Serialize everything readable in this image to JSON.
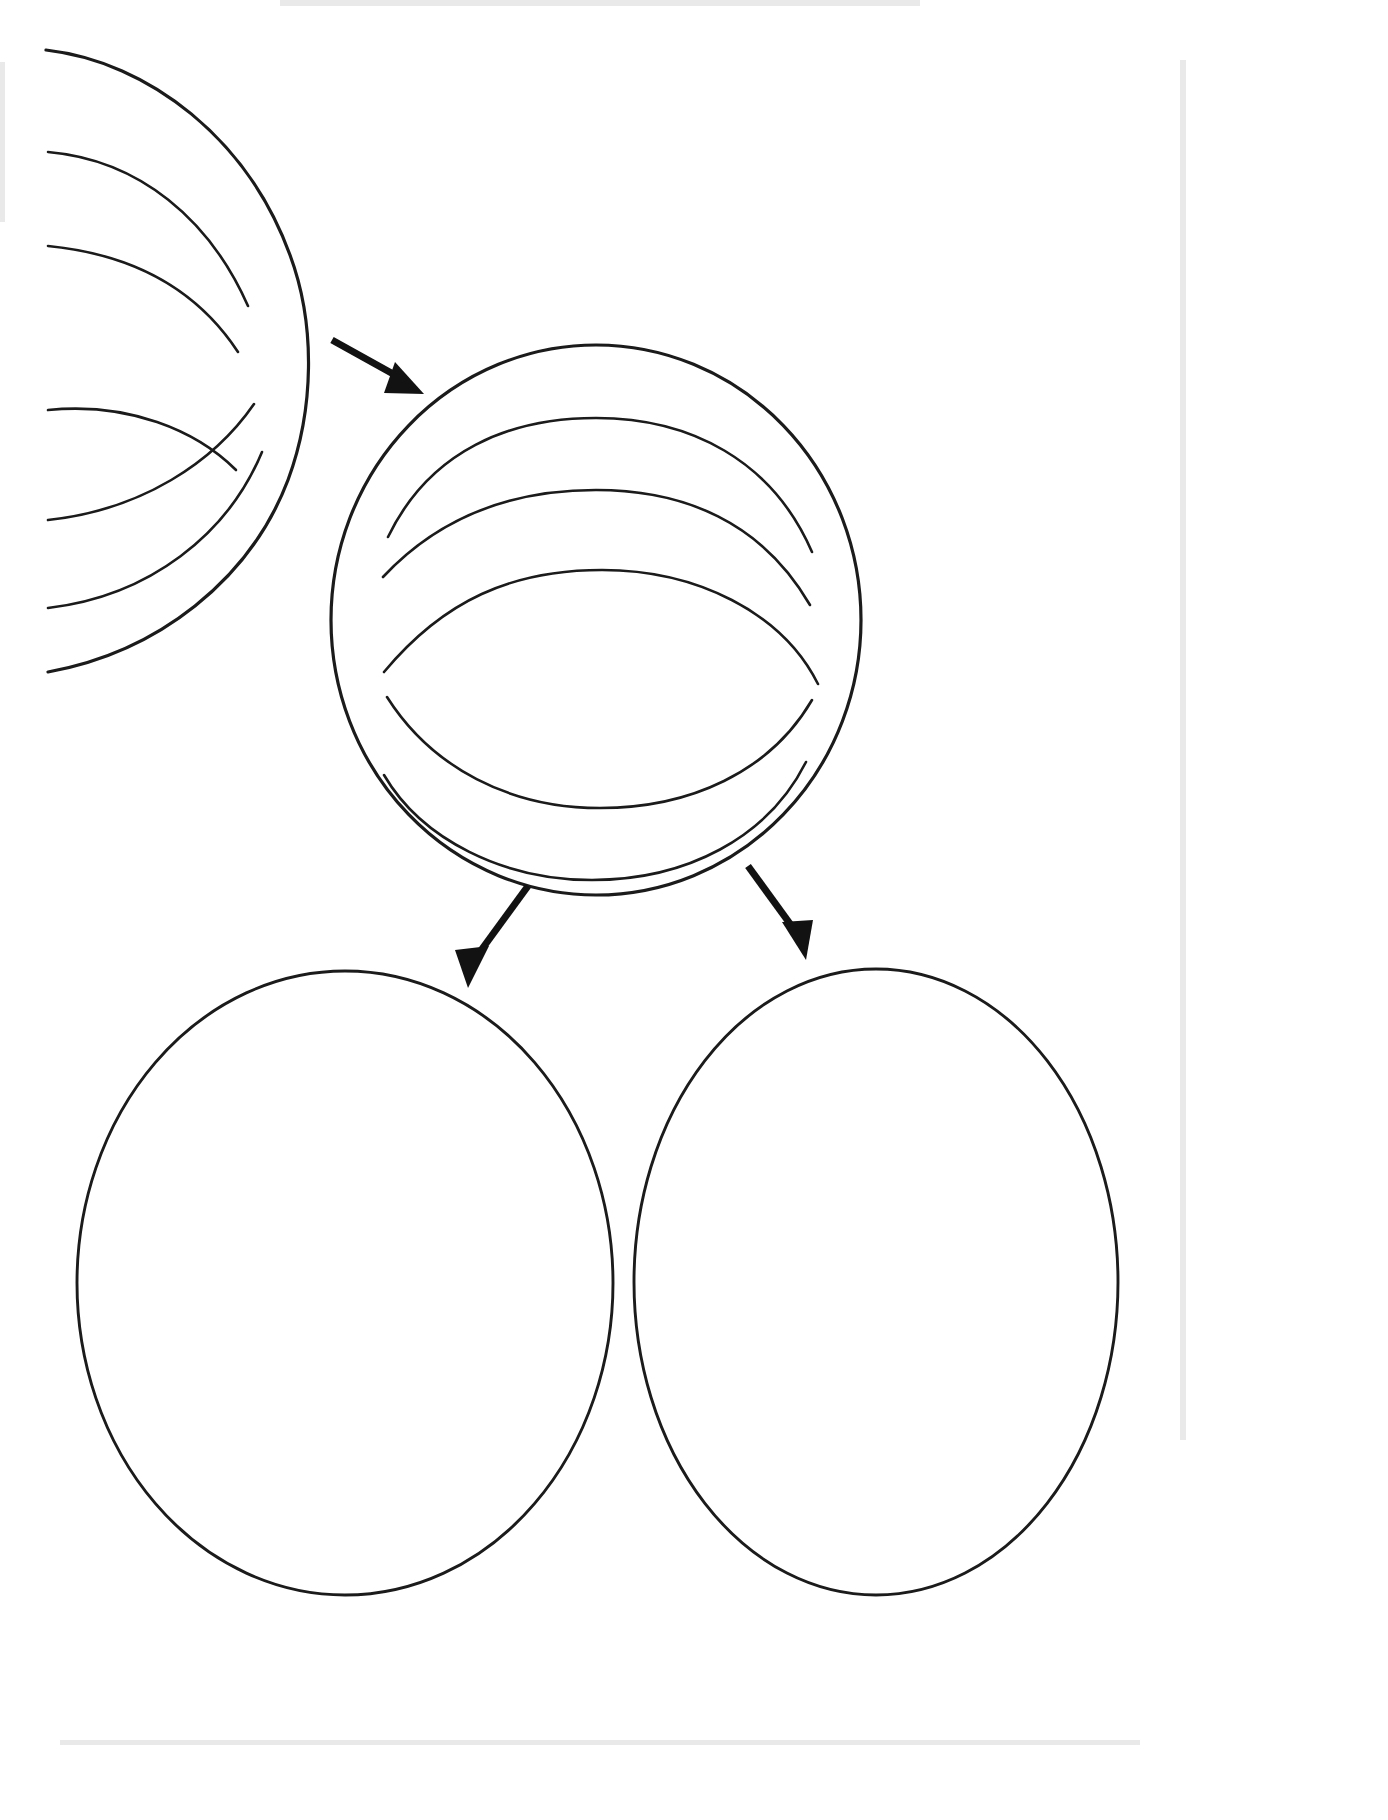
{
  "document": {
    "title": "Cell Division Diagram Worksheet",
    "kind": "line-drawing-diagram",
    "background_color": "#ffffff",
    "ink_color": "#1b1b1b",
    "arrow_color": "#121212",
    "width": 1388,
    "height": 1820,
    "visible_text": ""
  },
  "diagram": {
    "stages": [
      {
        "id": "parent-cell",
        "name": "parent-cell",
        "label": "",
        "shape": "circle-cropped-left",
        "center_x": 55,
        "center_y": 330,
        "radius": 280,
        "internal_fiber_count": 3,
        "internal_fiber_style": "radiating-curves"
      },
      {
        "id": "dividing-cell",
        "name": "dividing-cell",
        "label": "",
        "shape": "circle",
        "center_x": 596,
        "center_y": 620,
        "radius": 265,
        "internal_fiber_count": 4,
        "internal_fiber_style": "horizontal-arcs"
      },
      {
        "id": "daughter-cell-left",
        "name": "daughter-cell-left",
        "label": "",
        "shape": "circle",
        "center_x": 345,
        "center_y": 1283,
        "radius": 268,
        "internal_fiber_count": 0,
        "internal_fiber_style": "none"
      },
      {
        "id": "daughter-cell-right",
        "name": "daughter-cell-right",
        "label": "",
        "shape": "circle",
        "center_x": 876,
        "center_y": 1282,
        "radius": 242,
        "internal_fiber_count": 0,
        "internal_fiber_style": "none"
      }
    ],
    "arrows": [
      {
        "id": "arrow-parent-to-dividing",
        "name": "arrow-parent-to-dividing",
        "from": "parent-cell",
        "to": "dividing-cell",
        "start_x": 378,
        "start_y": 396,
        "end_x": 470,
        "end_y": 444,
        "direction": "down-right",
        "label": ""
      },
      {
        "id": "arrow-dividing-to-left",
        "name": "arrow-dividing-to-left",
        "from": "dividing-cell",
        "to": "daughter-cell-left",
        "start_x": 530,
        "start_y": 884,
        "end_x": 463,
        "end_y": 991,
        "direction": "down-left",
        "label": ""
      },
      {
        "id": "arrow-dividing-to-right",
        "name": "arrow-dividing-to-right",
        "from": "dividing-cell",
        "to": "daughter-cell-right",
        "start_x": 742,
        "start_y": 862,
        "end_x": 810,
        "end_y": 963,
        "direction": "down-right",
        "label": ""
      }
    ]
  },
  "chart_data": {
    "type": "diagram",
    "title": "",
    "nodes": [
      "parent-cell",
      "dividing-cell",
      "daughter-cell-left",
      "daughter-cell-right"
    ],
    "edges": [
      [
        "parent-cell",
        "dividing-cell"
      ],
      [
        "dividing-cell",
        "daughter-cell-left"
      ],
      [
        "dividing-cell",
        "daughter-cell-right"
      ]
    ]
  }
}
